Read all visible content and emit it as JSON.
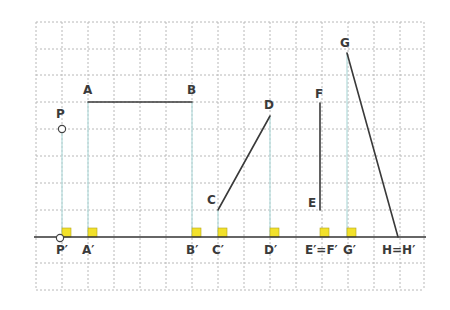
{
  "figure": {
    "grid": {
      "x0": 36,
      "y0": 22,
      "x1": 424,
      "y1": 290,
      "step_x": 26,
      "step_y": 26.8,
      "line_color": "#b8b8b8"
    },
    "baseline": {
      "y": 237,
      "x_start": 34,
      "x_end": 426,
      "color": "#333333"
    },
    "projection_color": "#b9dede",
    "marker_color": "#f2e12a",
    "points": [
      {
        "id": "P",
        "label": "P",
        "x": 62,
        "y": 129,
        "open_circle": true
      },
      {
        "id": "A",
        "label": "A",
        "x": 88,
        "y": 102
      },
      {
        "id": "B",
        "label": "B",
        "x": 192,
        "y": 102
      },
      {
        "id": "C",
        "label": "C",
        "x": 218,
        "y": 210
      },
      {
        "id": "D",
        "label": "D",
        "x": 270,
        "y": 116
      },
      {
        "id": "E",
        "label": "E",
        "x": 320,
        "y": 210
      },
      {
        "id": "F",
        "label": "F",
        "x": 320,
        "y": 103
      },
      {
        "id": "G",
        "label": "G",
        "x": 347,
        "y": 53
      },
      {
        "id": "H",
        "label": "H",
        "x": 398,
        "y": 237
      }
    ],
    "segments": [
      {
        "from": "A",
        "to": "B"
      },
      {
        "from": "C",
        "to": "D"
      },
      {
        "from": "E",
        "to": "F"
      },
      {
        "from": "G",
        "to": "H"
      }
    ],
    "projections": [
      {
        "label": "P′",
        "x": 62
      },
      {
        "label": "A′",
        "x": 88
      },
      {
        "label": "B′",
        "x": 192
      },
      {
        "label": "C′",
        "x": 218
      },
      {
        "label": "D′",
        "x": 270
      },
      {
        "label": "E′=F′",
        "x": 320
      },
      {
        "label": "G′",
        "x": 347
      },
      {
        "label": "H=H′",
        "x": 398
      }
    ],
    "labels": {
      "P": "P",
      "A": "A",
      "B": "B",
      "C": "C",
      "D": "D",
      "E": "E",
      "F": "F",
      "G": "G",
      "P_prime": "P′",
      "A_prime": "A′",
      "B_prime": "B′",
      "C_prime": "C′",
      "D_prime": "D′",
      "EF_prime": "E′=F′",
      "G_prime": "G′",
      "HH_prime": "H=H′"
    }
  }
}
